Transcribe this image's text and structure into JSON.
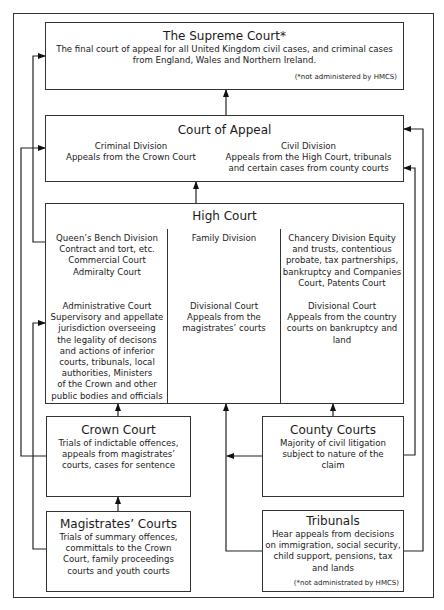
{
  "diagram": {
    "type": "court-hierarchy",
    "supreme_court": {
      "title": "The Supreme Court*",
      "description": "The final court of appeal for all United Kingdom civil cases, and criminal cases\nfrom England, Wales and Northern Ireland.",
      "note": "(*not administered by HMCS)"
    },
    "court_of_appeal": {
      "title": "Court of Appeal",
      "criminal_division": {
        "label": "Criminal Division",
        "description": "Appeals from the Crown Court"
      },
      "civil_division": {
        "label": "Civil Division",
        "description": "Appeals from the High Court, tribunals\nand certain cases from county courts"
      }
    },
    "high_court": {
      "title": "High Court",
      "queens_bench": "Queen’s Bench Division\nContract and tort, etc.\nCommercial Court\nAdmiralty Court",
      "administrative": "Administrative Court\nSupervisory and appellate\njurisdiction overseeing\nthe legality of decisons\nand actions of inferior\ncourts, tribunals, local\nauthorities, Ministers\nof the Crown and other\npublic bodies and officials",
      "family_division": "Family Division",
      "family_divisional": "Divisional Court\nAppeals from the\nmagistrates’ courts",
      "chancery": "Chancery Division Equity\nand trusts, contentious\nprobate, tax partnerships,\nbankruptcy and Companies\nCourt, Patents Court",
      "chancery_divisional": "Divisional Court\nAppeals from the country\ncourts on bankruptcy and\nland"
    },
    "crown_court": {
      "title": "Crown Court",
      "description": "Trials of indictable offences,\nappeals from magistrates’\ncourts, cases for sentence"
    },
    "county_courts": {
      "title": "County Courts",
      "description": "Majority of civil litigation\nsubject to nature of the\nclaim"
    },
    "magistrates_courts": {
      "title": "Magistrates’ Courts",
      "description": "Trials of summary offences,\ncommittals to the Crown\nCourt, family proceedings\ncourts and youth courts"
    },
    "tribunals": {
      "title": "Tribunals",
      "description": "Hear appeals from decisions\non immigration, social security,\nchild support, pensions, tax\nand lands",
      "note": "(*not administrated by HMCS)"
    }
  }
}
